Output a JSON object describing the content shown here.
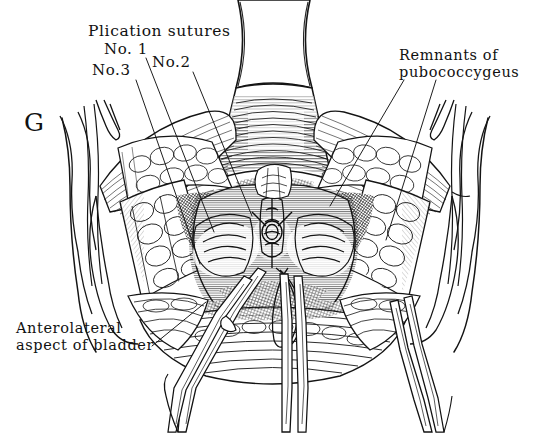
{
  "figure": {
    "panel_letter": "G",
    "background_color": "#ffffff",
    "ink_color": "#111111",
    "medium": "pen-and-ink line engraving"
  },
  "labels": {
    "plication_sutures": "Plication sutures",
    "no1": "No. 1",
    "no2": "No.2",
    "no3": "No.3",
    "remnants_line1": "Remnants of",
    "remnants_line2": "pubococcygeus",
    "anterolateral_line1": "Anterolateral",
    "anterolateral_line2": "aspect of bladder"
  }
}
